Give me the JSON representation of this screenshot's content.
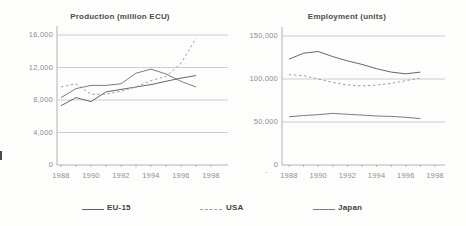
{
  "figure_background": "#fdfdfc",
  "colors": {
    "grid": "#cdcdcd",
    "axis": "#b2b2b2",
    "tick_label": "#8f8f8f",
    "title": "#4c4c4c",
    "legend_label": "#434343"
  },
  "chart_data": [
    {
      "id": "production",
      "type": "line",
      "title": "Production (million ECU)",
      "x": [
        1988,
        1989,
        1990,
        1991,
        1992,
        1993,
        1994,
        1995,
        1996,
        1997
      ],
      "x_tick_labels": [
        "1988",
        "1990",
        "1992",
        "1994",
        "1996",
        "1998"
      ],
      "x_tick_years": [
        1988,
        1990,
        1992,
        1994,
        1996,
        1998
      ],
      "xlim": [
        1988,
        1998
      ],
      "ylim": [
        0,
        16000
      ],
      "grid": "horizontal",
      "y_ticks": [
        {
          "value": 16000,
          "label": "16,000"
        },
        {
          "value": 12000,
          "label": "12,000"
        },
        {
          "value": 8000,
          "label": "8,000"
        },
        {
          "value": 4000,
          "label": "4,000"
        },
        {
          "value": 0,
          "label": "0"
        }
      ],
      "series": [
        {
          "name": "EU-15",
          "line_style": "solid",
          "color": "#666666",
          "values": [
            7300,
            8300,
            7800,
            9000,
            9300,
            9600,
            9900,
            10300,
            10700,
            11000
          ]
        },
        {
          "name": "USA",
          "line_style": "dashed",
          "color": "#9e9e9e",
          "values": [
            9600,
            10000,
            8700,
            8700,
            9100,
            9600,
            10400,
            10900,
            12500,
            15600
          ]
        },
        {
          "name": "Japan",
          "line_style": "solid",
          "color": "#7d7d7d",
          "values": [
            8300,
            9400,
            9800,
            9800,
            10000,
            11300,
            11800,
            11200,
            10300,
            9600
          ]
        }
      ]
    },
    {
      "id": "employment",
      "type": "line",
      "title": "Employment (units)",
      "x": [
        1988,
        1989,
        1990,
        1991,
        1992,
        1993,
        1994,
        1995,
        1996,
        1997
      ],
      "x_tick_labels": [
        "1988",
        "1990",
        "1992",
        "1994",
        "1996",
        "1998"
      ],
      "x_tick_years": [
        1988,
        1990,
        1992,
        1994,
        1996,
        1998
      ],
      "xlim": [
        1988,
        1998
      ],
      "ylim": [
        0,
        150000
      ],
      "grid": "horizontal",
      "y_ticks": [
        {
          "value": 150000,
          "label": "150,000"
        },
        {
          "value": 100000,
          "label": "100,000"
        },
        {
          "value": 50000,
          "label": "50,000"
        },
        {
          "value": 0,
          "label": "0"
        }
      ],
      "series": [
        {
          "name": "EU-15",
          "line_style": "solid",
          "color": "#666666",
          "values": [
            123000,
            130000,
            132000,
            126000,
            121000,
            117000,
            112000,
            108000,
            106000,
            108000
          ]
        },
        {
          "name": "USA",
          "line_style": "dashed",
          "color": "#9e9e9e",
          "values": [
            105000,
            104000,
            100000,
            96000,
            93000,
            92000,
            93000,
            95000,
            98000,
            101000
          ]
        },
        {
          "name": "Japan",
          "line_style": "solid",
          "color": "#7d7d7d",
          "values": [
            56000,
            57500,
            58500,
            60000,
            59000,
            58000,
            57000,
            56500,
            55500,
            54000
          ]
        }
      ]
    }
  ],
  "legend": {
    "position": "bottom",
    "items": [
      {
        "label": "EU-15",
        "line_style": "solid",
        "color": "#5f5f5f"
      },
      {
        "label": "USA",
        "line_style": "dashed",
        "color": "#9e9e9e"
      },
      {
        "label": "Japan",
        "line_style": "solid",
        "color": "#7d7d7d"
      }
    ]
  },
  "artifacts": {
    "stray_dot": ".",
    "left_edge_mark": true
  }
}
